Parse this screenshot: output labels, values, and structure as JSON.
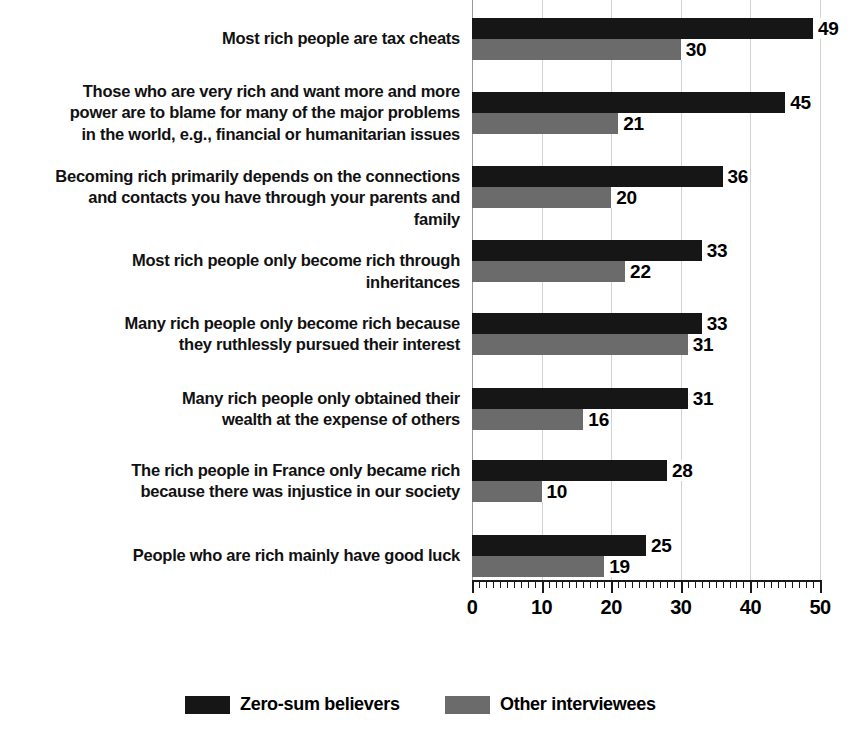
{
  "chart_data": {
    "type": "bar",
    "orientation": "horizontal",
    "title": "",
    "xlabel": "",
    "ylabel": "",
    "xlim": [
      0,
      50
    ],
    "xticks": [
      0,
      10,
      20,
      30,
      40,
      50
    ],
    "xtick_labels": [
      "0",
      "10",
      "20",
      "30",
      "40",
      "50"
    ],
    "minor_tick_step": 1,
    "grid": true,
    "grid_axis": "x",
    "legend_position": "bottom",
    "categories": [
      "Most rich people are tax cheats",
      "Those who are very rich and want more and more power are to blame for many of the major problems in the world, e.g., financial or humanitarian issues",
      "Becoming rich primarily depends on the connections and contacts you have through your parents and family",
      "Most rich people only become rich through inheritances",
      "Many rich people only become rich because they ruthlessly pursued their interest",
      "Many rich people only obtained their wealth at the expense of others",
      "The rich people in France only became rich because there was injustice in our society",
      "People who are rich mainly have good luck"
    ],
    "category_lines": [
      [
        "Most rich people are tax cheats"
      ],
      [
        "Those who are very rich and want more and more",
        "power are to blame for many of the major problems",
        "in the world, e.g., financial or humanitarian issues"
      ],
      [
        "Becoming rich primarily depends on the connections",
        "and contacts you have through your parents and family"
      ],
      [
        "Most rich people only become rich through inheritances"
      ],
      [
        "Many rich people only become rich because",
        "they ruthlessly pursued their interest"
      ],
      [
        "Many rich people only obtained their",
        "wealth at the expense of others"
      ],
      [
        "The rich people in France only became rich",
        "because there was injustice in our society"
      ],
      [
        "People who are rich mainly have good luck"
      ]
    ],
    "series": [
      {
        "name": "Zero-sum believers",
        "color": "#161616",
        "values": [
          49,
          45,
          36,
          33,
          33,
          31,
          28,
          25
        ]
      },
      {
        "name": "Other interviewees",
        "color": "#6b6b6b",
        "values": [
          30,
          21,
          20,
          22,
          31,
          16,
          10,
          19
        ]
      }
    ]
  },
  "legend": {
    "items": [
      {
        "label": "Zero-sum believers",
        "swatch": "black-swatch"
      },
      {
        "label": "Other interviewees",
        "swatch": "gray-swatch"
      }
    ]
  },
  "colors": {
    "series_black": "#161616",
    "series_gray": "#6b6b6b",
    "gridline": "#d2d2d2",
    "axis": "#1a1a1a",
    "background": "#ffffff"
  }
}
